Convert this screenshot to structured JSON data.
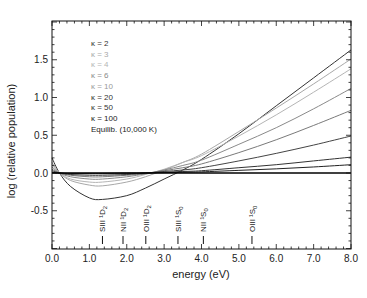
{
  "chart_data": {
    "type": "line",
    "title": "",
    "xlabel": "energy (eV)",
    "ylabel": "log (relative population)",
    "xlim": [
      0.0,
      8.0
    ],
    "ylim": [
      -1.0,
      2.0
    ],
    "xticks": [
      0.0,
      1.0,
      2.0,
      3.0,
      4.0,
      5.0,
      6.0,
      7.0,
      8.0
    ],
    "xtick_labels": [
      "0.0",
      "1.0",
      "2.0",
      "3.0",
      "4.0",
      "5.0",
      "6.0",
      "7.0",
      "8.0"
    ],
    "yticks": [
      -0.5,
      0.0,
      0.5,
      1.0,
      1.5
    ],
    "ytick_labels": [
      "-0.5",
      "0.0",
      "0.5",
      "1.0",
      "1.5"
    ],
    "grid": false,
    "legend_position": "upper-left (inside)",
    "x": [
      0.0,
      0.2,
      0.5,
      1.0,
      1.35,
      2.0,
      2.5,
      3.0,
      3.5,
      4.0,
      5.0,
      6.0,
      7.0,
      8.0
    ],
    "series": [
      {
        "name": "κ = 2",
        "color": "#333333",
        "values": [
          0.2,
          0.0,
          -0.18,
          -0.33,
          -0.35,
          -0.3,
          -0.2,
          -0.08,
          0.04,
          0.18,
          0.52,
          0.89,
          1.26,
          1.63
        ]
      },
      {
        "name": "κ = 3",
        "color": "#a8a8a8",
        "values": [
          0.14,
          0.0,
          -0.1,
          -0.16,
          -0.17,
          -0.12,
          -0.05,
          0.04,
          0.14,
          0.25,
          0.55,
          0.86,
          1.18,
          1.51
        ]
      },
      {
        "name": "κ = 4",
        "color": "#b5b5b5",
        "values": [
          0.11,
          0.0,
          -0.08,
          -0.12,
          -0.12,
          -0.08,
          -0.02,
          0.05,
          0.14,
          0.23,
          0.49,
          0.77,
          1.07,
          1.38
        ]
      },
      {
        "name": "κ = 6",
        "color": "#8a8a8a",
        "values": [
          0.08,
          0.0,
          -0.05,
          -0.08,
          -0.08,
          -0.05,
          -0.01,
          0.04,
          0.1,
          0.17,
          0.38,
          0.6,
          0.85,
          1.12
        ]
      },
      {
        "name": "κ = 10",
        "color": "#7a7a7a",
        "values": [
          0.05,
          0.0,
          -0.03,
          -0.05,
          -0.05,
          -0.03,
          -0.01,
          0.03,
          0.07,
          0.12,
          0.27,
          0.44,
          0.63,
          0.83
        ]
      },
      {
        "name": "κ = 20",
        "color": "#444444",
        "values": [
          0.03,
          0.0,
          -0.02,
          -0.03,
          -0.03,
          -0.02,
          0.0,
          0.02,
          0.04,
          0.07,
          0.16,
          0.26,
          0.37,
          0.49
        ]
      },
      {
        "name": "κ = 50",
        "color": "#333333",
        "values": [
          0.01,
          0.0,
          -0.01,
          -0.01,
          -0.01,
          -0.01,
          0.0,
          0.01,
          0.02,
          0.03,
          0.07,
          0.11,
          0.16,
          0.21
        ]
      },
      {
        "name": "κ = 100",
        "color": "#222222",
        "values": [
          0.005,
          0.0,
          -0.005,
          -0.005,
          -0.005,
          0.0,
          0.0,
          0.005,
          0.01,
          0.015,
          0.035,
          0.055,
          0.08,
          0.11
        ]
      },
      {
        "name": "Equilib. (10,000 K)",
        "color": "#000000",
        "values": [
          0.0,
          0.0,
          0.0,
          0.0,
          0.0,
          0.0,
          0.0,
          0.0,
          0.0,
          0.0,
          0.0,
          0.0,
          0.0,
          0.0
        ]
      }
    ],
    "annotations": [
      {
        "label": "SIII ¹D₂",
        "ion": "SIII",
        "term": "¹D",
        "sub": "2",
        "energy": 1.35
      },
      {
        "label": "NII ¹D₂",
        "ion": "NII",
        "term": "¹D",
        "sub": "2",
        "energy": 1.9
      },
      {
        "label": "OIII ¹D₂",
        "ion": "OIII",
        "term": "¹D",
        "sub": "2",
        "energy": 2.51
      },
      {
        "label": "SIII ¹S₀",
        "ion": "SIII",
        "term": "¹S",
        "sub": "0",
        "energy": 3.37
      },
      {
        "label": "NII ¹S₀",
        "ion": "NII",
        "term": "¹S",
        "sub": "0",
        "energy": 4.05
      },
      {
        "label": "OIII ¹S₀",
        "ion": "OIII",
        "term": "¹S",
        "sub": "0",
        "energy": 5.35
      }
    ]
  }
}
